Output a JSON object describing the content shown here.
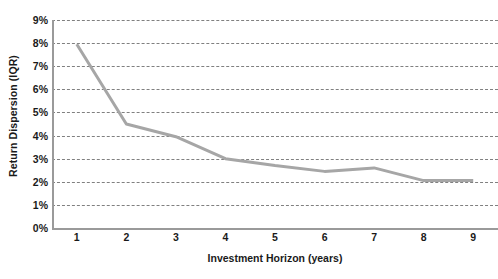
{
  "chart_data": {
    "type": "line",
    "title": "",
    "subtitle": "",
    "xlabel": "Investment Horizon (years)",
    "ylabel": "Return Dispersion (IQR)",
    "x": [
      1,
      2,
      3,
      4,
      5,
      6,
      7,
      8,
      9
    ],
    "xtick_labels": [
      "1",
      "2",
      "3",
      "4",
      "5",
      "6",
      "7",
      "8",
      "9"
    ],
    "values": [
      7.95,
      4.5,
      3.95,
      3.0,
      2.7,
      2.45,
      2.6,
      2.05,
      2.05
    ],
    "ytick_labels": [
      "0%",
      "1%",
      "2%",
      "3%",
      "4%",
      "5%",
      "6%",
      "7%",
      "8%",
      "9%"
    ],
    "ytick_values": [
      0,
      1,
      2,
      3,
      4,
      5,
      6,
      7,
      8,
      9
    ],
    "ylim": [
      0,
      9
    ],
    "xlim": [
      0.5,
      9.5
    ],
    "grid": {
      "horizontal": true,
      "vertical": false,
      "style": "dashed",
      "color": "#808080"
    },
    "legend": {
      "visible": false,
      "position": "none",
      "entries": []
    },
    "series": [
      {
        "name": "Return Dispersion (IQR)",
        "color": "#a6a6a6",
        "line_width": 3,
        "markers": false,
        "values": [
          7.95,
          4.5,
          3.95,
          3.0,
          2.7,
          2.45,
          2.6,
          2.05,
          2.05
        ]
      }
    ],
    "annotations": []
  },
  "axes": {
    "left_axis_color": "#9a9a9a",
    "bottom_axis_color": "#9a9a9a",
    "text_color": "#1a1a1a"
  },
  "background": "#ffffff"
}
